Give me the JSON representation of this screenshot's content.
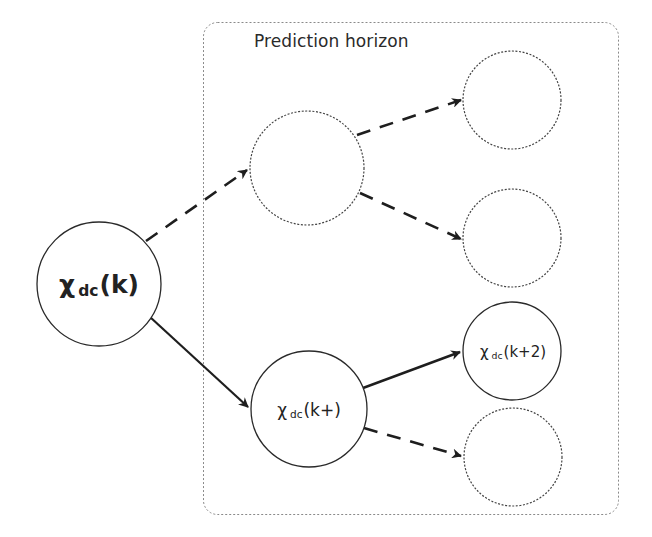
{
  "diagram": {
    "horizon_box": {
      "title": "Prediction horizon",
      "border_style": "dotted",
      "border_color": "#8a8a8a"
    },
    "nodes": [
      {
        "id": "root",
        "symbol": "χ",
        "subscript": "dc",
        "argument": "(k)",
        "style": "solid",
        "bold": true
      },
      {
        "id": "stage1_upper",
        "symbol": "",
        "subscript": "",
        "argument": "",
        "style": "dotted"
      },
      {
        "id": "stage1_lower",
        "symbol": "χ",
        "subscript": "dc",
        "argument": "(k+)",
        "style": "solid"
      },
      {
        "id": "stage2_a",
        "symbol": "",
        "subscript": "",
        "argument": "",
        "style": "dotted"
      },
      {
        "id": "stage2_b",
        "symbol": "",
        "subscript": "",
        "argument": "",
        "style": "dotted"
      },
      {
        "id": "stage2_c",
        "symbol": "χ",
        "subscript": "dc",
        "argument": "(k+2)",
        "style": "solid"
      },
      {
        "id": "stage2_d",
        "symbol": "",
        "subscript": "",
        "argument": "",
        "style": "dotted"
      }
    ],
    "edges": [
      {
        "from": "root",
        "to": "stage1_upper",
        "style": "dashed"
      },
      {
        "from": "root",
        "to": "stage1_lower",
        "style": "solid"
      },
      {
        "from": "stage1_upper",
        "to": "stage2_a",
        "style": "dashed"
      },
      {
        "from": "stage1_upper",
        "to": "stage2_b",
        "style": "dashed"
      },
      {
        "from": "stage1_lower",
        "to": "stage2_c",
        "style": "solid"
      },
      {
        "from": "stage1_lower",
        "to": "stage2_d",
        "style": "dashed"
      }
    ],
    "colors": {
      "line": "#1e1e1e",
      "dotted_circle": "#555555",
      "background": "#ffffff"
    }
  }
}
